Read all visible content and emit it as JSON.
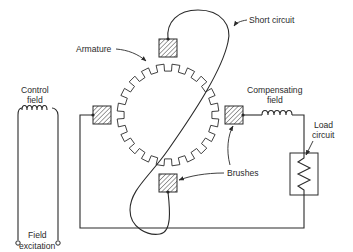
{
  "diagram": {
    "type": "electrical schematic",
    "colors": {
      "ink": "#2a2a2a",
      "background": "#ffffff",
      "hatch": "#2a2a2a"
    },
    "labels": {
      "armature": "Armature",
      "short_circuit": "Short circuit",
      "control_field_line1": "Control",
      "control_field_line2": "field",
      "compensating_field_line1": "Compensating",
      "compensating_field_line2": "field",
      "load_circuit_line1": "Load",
      "load_circuit_line2": "circuit",
      "brushes": "Brushes",
      "field_excitation_line1": "Field",
      "field_excitation_line2": "excitation"
    },
    "components": [
      {
        "id": "armature",
        "shape": "toothed ring",
        "teeth": 20
      },
      {
        "id": "brush-top",
        "position": "top",
        "hatched": true
      },
      {
        "id": "brush-bottom",
        "position": "bottom",
        "hatched": true
      },
      {
        "id": "brush-left",
        "position": "left",
        "hatched": true
      },
      {
        "id": "brush-right",
        "position": "right",
        "hatched": true
      },
      {
        "id": "short-circuit",
        "connects": [
          "brush-top",
          "brush-bottom"
        ]
      },
      {
        "id": "control-field-coil",
        "turns": 5
      },
      {
        "id": "compensating-field-coil",
        "turns": 5
      },
      {
        "id": "load-resistor",
        "shape": "zigzag in box"
      },
      {
        "id": "field-excitation-terminals",
        "count": 2
      }
    ]
  }
}
